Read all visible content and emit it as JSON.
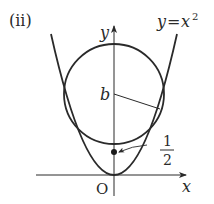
{
  "figure": {
    "panel_label": "(ii)",
    "curve_label_lhs": "y",
    "curve_label_eq": "=",
    "curve_label_rhs": "x",
    "curve_label_exp": "2",
    "axis_y_label": "y",
    "axis_x_label": "x",
    "origin_label": "O",
    "center_label": "b",
    "point_label_num": "1",
    "point_label_den": "2",
    "colors": {
      "stroke": "#2a2a2a",
      "background": "#ffffff"
    }
  }
}
